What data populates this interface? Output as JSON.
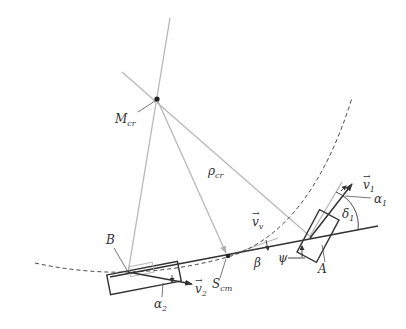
{
  "diagram": {
    "type": "vehicle single-track (bicycle) kinematic model",
    "labels": {
      "instant_center": "M",
      "instant_center_sub": "cr",
      "radius": "ρ",
      "radius_sub": "cr",
      "velocity_vehicle": "v",
      "velocity_vehicle_sub": "v",
      "velocity_front": "v",
      "velocity_front_sub": "1",
      "velocity_rear": "v",
      "velocity_rear_sub": "2",
      "slip_front": "α",
      "slip_front_sub": "1",
      "slip_rear": "α",
      "slip_rear_sub": "2",
      "steer_angle": "δ",
      "steer_angle_sub": "1",
      "sideslip": "β",
      "yaw": "ψ",
      "center_of_mass": "S",
      "center_of_mass_sub": "cm",
      "front_axle": "A",
      "rear_axle": "B",
      "vec_arrow": "→"
    },
    "colors": {
      "construction_line": "#b5b5b5",
      "body_line": "#333333",
      "path_dashed": "#444444",
      "text": "#333333"
    }
  }
}
